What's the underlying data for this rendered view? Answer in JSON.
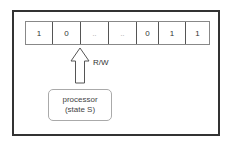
{
  "diagram": {
    "tape": {
      "cells": [
        {
          "value": "1",
          "width": 27
        },
        {
          "value": "0",
          "width": 28
        },
        {
          "value": "..",
          "width": 28
        },
        {
          "value": "..",
          "width": 28
        },
        {
          "value": "0",
          "width": 22
        },
        {
          "value": "1",
          "width": 27
        },
        {
          "value": "1",
          "width": 23
        }
      ]
    },
    "head_label": "R/W",
    "processor": {
      "line1": "processor",
      "line2": "(state S)"
    },
    "colors": {
      "frame": "#333333",
      "tape_border": "#555555",
      "processor_border": "#aaaaaa",
      "text": "#333333"
    }
  }
}
